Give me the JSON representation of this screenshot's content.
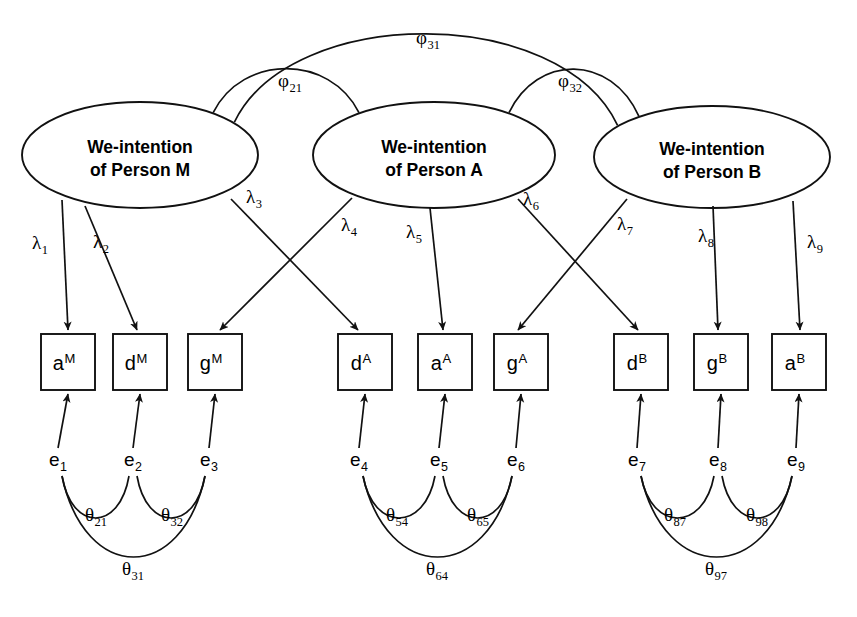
{
  "figure": {
    "background_color": "#ffffff",
    "line_color": "#111111"
  },
  "chart_data": {
    "type": "diagram",
    "title": "",
    "latent_factors": [
      {
        "id": "F1",
        "line1": "We-intention",
        "line2": "of Person M",
        "cx": 140,
        "cy": 155,
        "rx": 118,
        "ry": 53
      },
      {
        "id": "F2",
        "line1": "We-intention",
        "line2": "of Person A",
        "cx": 434,
        "cy": 155,
        "rx": 121,
        "ry": 53
      },
      {
        "id": "F3",
        "line1": "We-intention",
        "line2": "of Person B",
        "cx": 712,
        "cy": 157,
        "rx": 118,
        "ry": 51
      }
    ],
    "indicators": [
      {
        "id": "I1",
        "base": "a",
        "sup": "M",
        "x": 41,
        "y": 334,
        "w": 54,
        "h": 56
      },
      {
        "id": "I2",
        "base": "d",
        "sup": "M",
        "x": 113,
        "y": 334,
        "w": 54,
        "h": 56
      },
      {
        "id": "I3",
        "base": "g",
        "sup": "M",
        "x": 188,
        "y": 334,
        "w": 54,
        "h": 56
      },
      {
        "id": "I4",
        "base": "d",
        "sup": "A",
        "x": 338,
        "y": 334,
        "w": 54,
        "h": 56
      },
      {
        "id": "I5",
        "base": "a",
        "sup": "A",
        "x": 418,
        "y": 334,
        "w": 54,
        "h": 56
      },
      {
        "id": "I6",
        "base": "g",
        "sup": "A",
        "x": 494,
        "y": 334,
        "w": 54,
        "h": 56
      },
      {
        "id": "I7",
        "base": "d",
        "sup": "B",
        "x": 614,
        "y": 334,
        "w": 54,
        "h": 56
      },
      {
        "id": "I8",
        "base": "g",
        "sup": "B",
        "x": 694,
        "y": 334,
        "w": 54,
        "h": 56
      },
      {
        "id": "I9",
        "base": "a",
        "sup": "B",
        "x": 772,
        "y": 334,
        "w": 54,
        "h": 56
      }
    ],
    "errors": [
      {
        "id": "E1",
        "base": "e",
        "sub": "1",
        "x": 58,
        "y": 466
      },
      {
        "id": "E2",
        "base": "e",
        "sub": "2",
        "x": 133,
        "y": 466
      },
      {
        "id": "E3",
        "base": "e",
        "sub": "3",
        "x": 209,
        "y": 466
      },
      {
        "id": "E4",
        "base": "e",
        "sub": "4",
        "x": 359,
        "y": 466
      },
      {
        "id": "E5",
        "base": "e",
        "sub": "5",
        "x": 439,
        "y": 466
      },
      {
        "id": "E6",
        "base": "e",
        "sub": "6",
        "x": 516,
        "y": 466
      },
      {
        "id": "E7",
        "base": "e",
        "sub": "7",
        "x": 637,
        "y": 466
      },
      {
        "id": "E8",
        "base": "e",
        "sub": "8",
        "x": 718,
        "y": 466
      },
      {
        "id": "E9",
        "base": "e",
        "sub": "9",
        "x": 796,
        "y": 466
      }
    ],
    "loadings": [
      {
        "id": "L1",
        "base": "λ",
        "sub": "1",
        "from": "F1",
        "to": "I1",
        "x1": 62,
        "y1": 200,
        "x2": 68,
        "y2": 330,
        "lx": 40,
        "ly": 249
      },
      {
        "id": "L2",
        "base": "λ",
        "sub": "2",
        "from": "F1",
        "to": "I2",
        "x1": 85,
        "y1": 206,
        "x2": 137,
        "y2": 330,
        "lx": 101,
        "ly": 248
      },
      {
        "id": "L3",
        "base": "λ",
        "sub": "3",
        "from": "F1",
        "to": "I4",
        "x1": 231,
        "y1": 199,
        "x2": 358,
        "y2": 330,
        "lx": 254,
        "ly": 203
      },
      {
        "id": "L4",
        "base": "λ",
        "sub": "4",
        "from": "F2",
        "to": "I3",
        "x1": 352,
        "y1": 198,
        "x2": 220,
        "y2": 330,
        "lx": 349,
        "ly": 231
      },
      {
        "id": "L5",
        "base": "λ",
        "sub": "5",
        "from": "F2",
        "to": "I5",
        "x1": 430,
        "y1": 208,
        "x2": 443,
        "y2": 330,
        "lx": 414,
        "ly": 238
      },
      {
        "id": "L6",
        "base": "λ",
        "sub": "6",
        "from": "F2",
        "to": "I7",
        "x1": 518,
        "y1": 199,
        "x2": 638,
        "y2": 330,
        "lx": 531,
        "ly": 205
      },
      {
        "id": "L7",
        "base": "λ",
        "sub": "7",
        "from": "F3",
        "to": "I6",
        "x1": 627,
        "y1": 199,
        "x2": 518,
        "y2": 330,
        "lx": 625,
        "ly": 230
      },
      {
        "id": "L8",
        "base": "λ",
        "sub": "8",
        "from": "F3",
        "to": "I8",
        "x1": 713,
        "y1": 206,
        "x2": 718,
        "y2": 330,
        "lx": 706,
        "ly": 242
      },
      {
        "id": "L9",
        "base": "λ",
        "sub": "9",
        "from": "F3",
        "to": "I9",
        "x1": 793,
        "y1": 201,
        "x2": 800,
        "y2": 330,
        "lx": 815,
        "ly": 248
      }
    ],
    "factor_covariances": [
      {
        "id": "P21",
        "base": "φ",
        "sub": "21",
        "between": [
          "F1",
          "F2"
        ],
        "lx": 290,
        "ly": 87
      },
      {
        "id": "P32",
        "base": "φ",
        "sub": "32",
        "between": [
          "F2",
          "F3"
        ],
        "lx": 570,
        "ly": 87
      },
      {
        "id": "P31",
        "base": "φ",
        "sub": "31",
        "between": [
          "F1",
          "F3"
        ],
        "lx": 428,
        "ly": 44
      }
    ],
    "error_covariances": [
      {
        "id": "T21",
        "base": "θ",
        "sub": "21",
        "between": [
          "E1",
          "E2"
        ],
        "lx": 96,
        "ly": 521
      },
      {
        "id": "T32",
        "base": "θ",
        "sub": "32",
        "between": [
          "E2",
          "E3"
        ],
        "lx": 172,
        "ly": 521
      },
      {
        "id": "T31",
        "base": "θ",
        "sub": "31",
        "between": [
          "E1",
          "E3"
        ],
        "lx": 133,
        "ly": 575
      },
      {
        "id": "T54",
        "base": "θ",
        "sub": "54",
        "between": [
          "E4",
          "E5"
        ],
        "lx": 397,
        "ly": 521
      },
      {
        "id": "T65",
        "base": "θ",
        "sub": "65",
        "between": [
          "E5",
          "E6"
        ],
        "lx": 478,
        "ly": 521
      },
      {
        "id": "T64",
        "base": "θ",
        "sub": "64",
        "between": [
          "E4",
          "E6"
        ],
        "lx": 437,
        "ly": 575
      },
      {
        "id": "T87",
        "base": "θ",
        "sub": "87",
        "between": [
          "E7",
          "E8"
        ],
        "lx": 675,
        "ly": 521
      },
      {
        "id": "T98",
        "base": "θ",
        "sub": "98",
        "between": [
          "E8",
          "E9"
        ],
        "lx": 757,
        "ly": 521
      },
      {
        "id": "T97",
        "base": "θ",
        "sub": "97",
        "between": [
          "E7",
          "E9"
        ],
        "lx": 716,
        "ly": 575
      }
    ]
  }
}
